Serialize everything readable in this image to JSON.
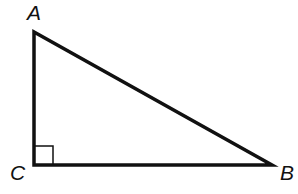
{
  "diagram": {
    "type": "right-triangle",
    "vertices": [
      {
        "label": "A",
        "x": 34,
        "y": 32
      },
      {
        "label": "C",
        "x": 34,
        "y": 165
      },
      {
        "label": "B",
        "x": 272,
        "y": 165
      }
    ],
    "right_angle_at": "C",
    "stroke_color": "#111111",
    "background": "#ffffff"
  }
}
